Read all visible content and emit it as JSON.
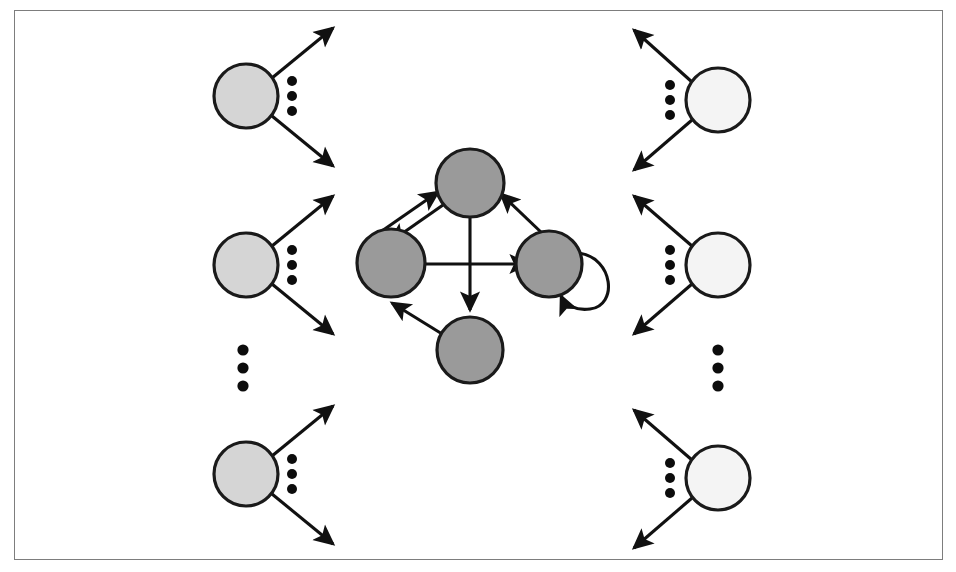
{
  "figure": {
    "background_color": "#ffffff",
    "frame": {
      "name": "figure-border",
      "x": 14,
      "y": 10,
      "width": 929,
      "height": 550,
      "stroke_color": "#7d7d7d",
      "stroke_width": 1.4
    }
  },
  "palette": {
    "input_node_fill": "#d5d5d5",
    "core_node_fill": "#9a9a9a",
    "output_node_fill": "#f4f4f4",
    "node_stroke": "#1a1a1a",
    "edge_color": "#111111",
    "dot_color": "#0c0c0c"
  },
  "chart_data": {
    "type": "diagram",
    "node_groups": [
      {
        "group": "input-nodes",
        "label": "left column input nodes",
        "fill": "#d5d5d5",
        "count_shown": 3,
        "continuation": "vertical-ellipsis",
        "nodes": [
          {
            "id": "L1",
            "cx": 246,
            "cy": 96,
            "r": 32
          },
          {
            "id": "L2",
            "cx": 246,
            "cy": 265,
            "r": 32
          },
          {
            "id": "L3",
            "cx": 246,
            "cy": 474,
            "r": 32
          }
        ]
      },
      {
        "group": "core-nodes",
        "label": "central directed core graph nodes",
        "fill": "#9a9a9a",
        "count_shown": 4,
        "nodes": [
          {
            "id": "C_top",
            "cx": 470,
            "cy": 183,
            "r": 34
          },
          {
            "id": "C_left",
            "cx": 391,
            "cy": 263,
            "r": 34
          },
          {
            "id": "C_right",
            "cx": 549,
            "cy": 264,
            "r": 33
          },
          {
            "id": "C_bottom",
            "cx": 470,
            "cy": 350,
            "r": 33
          }
        ]
      },
      {
        "group": "output-nodes",
        "label": "right column output nodes",
        "fill": "#f4f4f4",
        "count_shown": 3,
        "continuation": "vertical-ellipsis",
        "nodes": [
          {
            "id": "R1",
            "cx": 718,
            "cy": 100,
            "r": 32
          },
          {
            "id": "R2",
            "cx": 718,
            "cy": 265,
            "r": 32
          },
          {
            "id": "R3",
            "cx": 718,
            "cy": 478,
            "r": 32
          }
        ]
      }
    ],
    "core_edges": [
      {
        "from": "C_left",
        "to": "C_top",
        "kind": "directed",
        "note": "parallel pair, upper arrow"
      },
      {
        "from": "C_top",
        "to": "C_left",
        "kind": "directed",
        "note": "parallel pair, lower arrow"
      },
      {
        "from": "C_right",
        "to": "C_top",
        "kind": "directed"
      },
      {
        "from": "C_left",
        "to": "C_right",
        "kind": "directed"
      },
      {
        "from": "C_top",
        "to": "C_bottom",
        "kind": "directed"
      },
      {
        "from": "C_bottom",
        "to": "C_left",
        "kind": "directed"
      },
      {
        "from": "C_right",
        "to": "C_right",
        "kind": "self-loop"
      }
    ],
    "peripheral_edges": [
      {
        "group": "input-nodes",
        "node": "L1",
        "direction": "outgoing",
        "arrows": [
          "up-right",
          "down-right"
        ]
      },
      {
        "group": "input-nodes",
        "node": "L2",
        "direction": "outgoing",
        "arrows": [
          "up-right",
          "down-right"
        ]
      },
      {
        "group": "input-nodes",
        "node": "L3",
        "direction": "outgoing",
        "arrows": [
          "up-right",
          "down-right"
        ]
      },
      {
        "group": "output-nodes",
        "node": "R1",
        "direction": "outgoing",
        "arrows": [
          "up-left",
          "down-left"
        ]
      },
      {
        "group": "output-nodes",
        "node": "R2",
        "direction": "outgoing",
        "arrows": [
          "up-left",
          "down-left"
        ]
      },
      {
        "group": "output-nodes",
        "node": "R3",
        "direction": "outgoing",
        "arrows": [
          "up-left",
          "down-left"
        ]
      }
    ],
    "ellipses": [
      {
        "id": "E_L1",
        "type": "vertical",
        "cx": 292,
        "cy": 96,
        "dots": 3,
        "spacing": 15,
        "r": 5.0
      },
      {
        "id": "E_L2",
        "type": "vertical",
        "cx": 292,
        "cy": 265,
        "dots": 3,
        "spacing": 15,
        "r": 5.0
      },
      {
        "id": "E_L3",
        "type": "vertical",
        "cx": 292,
        "cy": 474,
        "dots": 3,
        "spacing": 15,
        "r": 5.0
      },
      {
        "id": "E_Lcol",
        "type": "vertical",
        "cx": 243,
        "cy": 368,
        "dots": 3,
        "spacing": 18,
        "r": 5.6
      },
      {
        "id": "E_R1",
        "type": "vertical",
        "cx": 670,
        "cy": 100,
        "dots": 3,
        "spacing": 15,
        "r": 5.0
      },
      {
        "id": "E_R2",
        "type": "vertical",
        "cx": 670,
        "cy": 265,
        "dots": 3,
        "spacing": 15,
        "r": 5.0
      },
      {
        "id": "E_R3",
        "type": "vertical",
        "cx": 670,
        "cy": 478,
        "dots": 3,
        "spacing": 15,
        "r": 5.0
      },
      {
        "id": "E_Rcol",
        "type": "vertical",
        "cx": 718,
        "cy": 368,
        "dots": 3,
        "spacing": 18,
        "r": 5.6
      }
    ],
    "legend": [],
    "annotations": [],
    "axis_labels": null,
    "grid": false
  }
}
